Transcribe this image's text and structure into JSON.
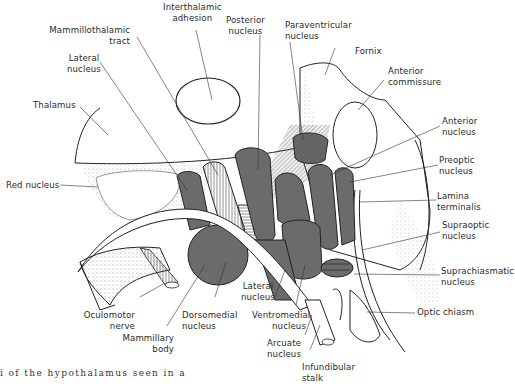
{
  "figure": {
    "type": "anatomical-diagram",
    "caption_fragment": "i  of  the  hypothalamus  seen  in  a",
    "colors": {
      "nucleus_fill": "#6b6b6b",
      "outline": "#222222",
      "background": "#ffffff",
      "stipple": "#9a9a9a"
    }
  },
  "labels": {
    "interthalamic_adhesion": [
      "Interthalamic",
      "adhesion"
    ],
    "posterior_nucleus": [
      "Posterior",
      "nucleus"
    ],
    "paraventricular_nucleus": [
      "Paraventricular",
      "nucleus"
    ],
    "mammillothalamic_tract": [
      "Mammillothalamic",
      "tract"
    ],
    "fornix": "Fornix",
    "lateral_nucleus_top": [
      "Lateral",
      "nucleus"
    ],
    "anterior_commissure": [
      "Anterior",
      "commissure"
    ],
    "thalamus": "Thalamus",
    "anterior_nucleus": [
      "Anterior",
      "nucleus"
    ],
    "preoptic_nucleus": [
      "Preoptic",
      "nucleus"
    ],
    "red_nucleus": "Red nucleus",
    "lamina_terminalis": [
      "Lamina",
      "terminalis"
    ],
    "supraoptic_nucleus": [
      "Supraoptic",
      "nucleus"
    ],
    "suprachiasmatic_nucleus": [
      "Suprachiasmatic",
      "nucleus"
    ],
    "lateral_nucleus_bottom": [
      "Lateral",
      "nucleus"
    ],
    "oculomotor_nerve": [
      "Oculomotor",
      "nerve"
    ],
    "dorsomedial_nucleus": [
      "Dorsomedial",
      "nucleus"
    ],
    "ventromedial_nucleus": [
      "Ventromedial",
      "nucleus"
    ],
    "optic_chiasm": "Optic chiasm",
    "mammillary_body": [
      "Mammillary",
      "body"
    ],
    "arcuate_nucleus": [
      "Arcuate",
      "nucleus"
    ],
    "infundibular_stalk": [
      "Infundibular",
      "stalk"
    ]
  }
}
